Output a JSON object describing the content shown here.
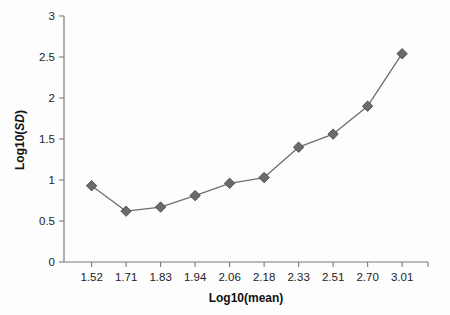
{
  "chart_data": {
    "type": "line",
    "title": "",
    "xlabel": "Log10(mean)",
    "ylabel": "Log10(SD)",
    "categories": [
      "1.52",
      "1.71",
      "1.83",
      "1.94",
      "2.06",
      "2.18",
      "2.33",
      "2.51",
      "2.70",
      "3.01"
    ],
    "values": [
      0.93,
      0.62,
      0.67,
      0.81,
      0.96,
      1.03,
      1.4,
      1.56,
      1.9,
      2.54
    ],
    "ylim": [
      0,
      3
    ],
    "yticks": [
      "0",
      "0.5",
      "1",
      "1.5",
      "2",
      "2.5",
      "3"
    ],
    "ytick_values": [
      0,
      0.5,
      1,
      1.5,
      2,
      2.5,
      3
    ],
    "grid": false,
    "legend": false,
    "marker": "diamond",
    "series_color": "#6b6b6b",
    "axis_color": "#7b7b7b"
  },
  "axes": {
    "x_title": "Log10(mean)",
    "y_title_main": "Log10(",
    "y_title_italic": "SD",
    "y_title_close": ")"
  }
}
